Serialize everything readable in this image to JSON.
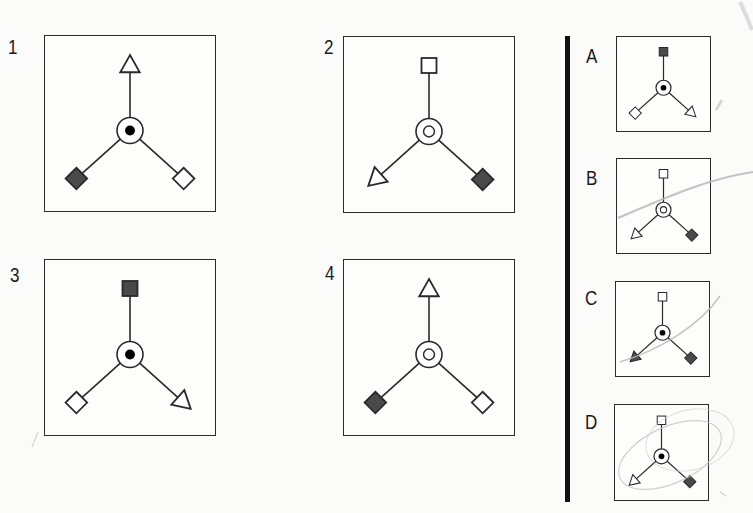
{
  "puzzle": {
    "question_figures": [
      {
        "label": "1",
        "center": "dot",
        "top": {
          "shape": "triangle",
          "fill": "white"
        },
        "left": {
          "shape": "diamond",
          "fill": "dark"
        },
        "right": {
          "shape": "diamond",
          "fill": "white"
        }
      },
      {
        "label": "2",
        "center": "ring",
        "top": {
          "shape": "square",
          "fill": "white"
        },
        "left": {
          "shape": "triangle",
          "fill": "white"
        },
        "right": {
          "shape": "diamond",
          "fill": "dark"
        }
      },
      {
        "label": "3",
        "center": "dot",
        "top": {
          "shape": "square",
          "fill": "dark"
        },
        "left": {
          "shape": "diamond",
          "fill": "white"
        },
        "right": {
          "shape": "triangle",
          "fill": "white"
        }
      },
      {
        "label": "4",
        "center": "ring",
        "top": {
          "shape": "triangle",
          "fill": "white"
        },
        "left": {
          "shape": "diamond",
          "fill": "dark"
        },
        "right": {
          "shape": "diamond",
          "fill": "white"
        }
      }
    ],
    "answer_options": [
      {
        "label": "A",
        "center": "dot",
        "top": {
          "shape": "square",
          "fill": "dark"
        },
        "left": {
          "shape": "diamond",
          "fill": "white"
        },
        "right": {
          "shape": "triangle",
          "fill": "white"
        }
      },
      {
        "label": "B",
        "center": "ring",
        "top": {
          "shape": "square",
          "fill": "white"
        },
        "left": {
          "shape": "triangle",
          "fill": "white"
        },
        "right": {
          "shape": "diamond",
          "fill": "dark"
        }
      },
      {
        "label": "C",
        "center": "dot",
        "top": {
          "shape": "square",
          "fill": "white"
        },
        "left": {
          "shape": "triangle",
          "fill": "dark"
        },
        "right": {
          "shape": "diamond",
          "fill": "dark"
        }
      },
      {
        "label": "D",
        "center": "dot",
        "top": {
          "shape": "square",
          "fill": "white"
        },
        "left": {
          "shape": "triangle",
          "fill": "white"
        },
        "right": {
          "shape": "diamond",
          "fill": "dark"
        }
      }
    ]
  },
  "colors": {
    "dark_fill": "#4a4a4a",
    "line": "#2a2a2a",
    "white_fill": "#ffffff",
    "pencil": "#b8b8b8"
  }
}
